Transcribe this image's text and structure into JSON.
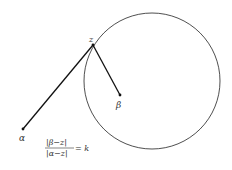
{
  "diagram": {
    "points": {
      "z": {
        "label": "z",
        "x": 93,
        "y": 45
      },
      "beta": {
        "label": "β",
        "x": 120,
        "y": 95
      },
      "alpha": {
        "label": "α",
        "x": 23,
        "y": 129
      }
    },
    "circle": {
      "cx": 152,
      "cy": 81,
      "r": 68
    },
    "formula": {
      "numerator": "|β−z|",
      "denominator": "|α−z|",
      "rhs": "= k"
    },
    "colors": {
      "line": "#111111",
      "text": "#333333"
    }
  }
}
